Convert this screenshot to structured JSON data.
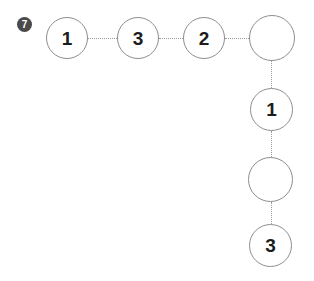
{
  "badge": {
    "label": "7",
    "color": "#4a4a4a",
    "text_color": "#ffffff"
  },
  "diagram": {
    "background": "#ffffff",
    "node_border_color": "#8e8e8e",
    "node_fill": "#ffffff",
    "node_text_color": "#1c1c1c",
    "connector_color": "#9a9a9a",
    "connector_style": "dotted",
    "shape": "L-shaped chain",
    "nodes": [
      {
        "id": "n1",
        "label": "1",
        "x": 46,
        "y": 17,
        "size": 42,
        "empty": false
      },
      {
        "id": "n2",
        "label": "3",
        "x": 117,
        "y": 17,
        "size": 42,
        "empty": false
      },
      {
        "id": "n3",
        "label": "2",
        "x": 183,
        "y": 17,
        "size": 42,
        "empty": false
      },
      {
        "id": "n4",
        "label": "",
        "x": 249,
        "y": 15,
        "size": 46,
        "empty": true
      },
      {
        "id": "n5",
        "label": "1",
        "x": 250,
        "y": 88,
        "size": 43,
        "empty": false
      },
      {
        "id": "n6",
        "label": "",
        "x": 248,
        "y": 157,
        "size": 45,
        "empty": true
      },
      {
        "id": "n7",
        "label": "3",
        "x": 249,
        "y": 224,
        "size": 43,
        "empty": false
      }
    ],
    "connectors": [
      {
        "id": "c1",
        "from": "n1",
        "to": "n2",
        "orientation": "horizontal",
        "x": 88,
        "y": 38,
        "length": 29
      },
      {
        "id": "c2",
        "from": "n2",
        "to": "n3",
        "orientation": "horizontal",
        "x": 159,
        "y": 38,
        "length": 24
      },
      {
        "id": "c3",
        "from": "n3",
        "to": "n4",
        "orientation": "horizontal",
        "x": 225,
        "y": 38,
        "length": 24
      },
      {
        "id": "c4",
        "from": "n4",
        "to": "n5",
        "orientation": "vertical",
        "x": 271,
        "y": 61,
        "length": 27
      },
      {
        "id": "c5",
        "from": "n5",
        "to": "n6",
        "orientation": "vertical",
        "x": 271,
        "y": 131,
        "length": 26
      },
      {
        "id": "c6",
        "from": "n6",
        "to": "n7",
        "orientation": "vertical",
        "x": 271,
        "y": 202,
        "length": 22
      }
    ]
  }
}
